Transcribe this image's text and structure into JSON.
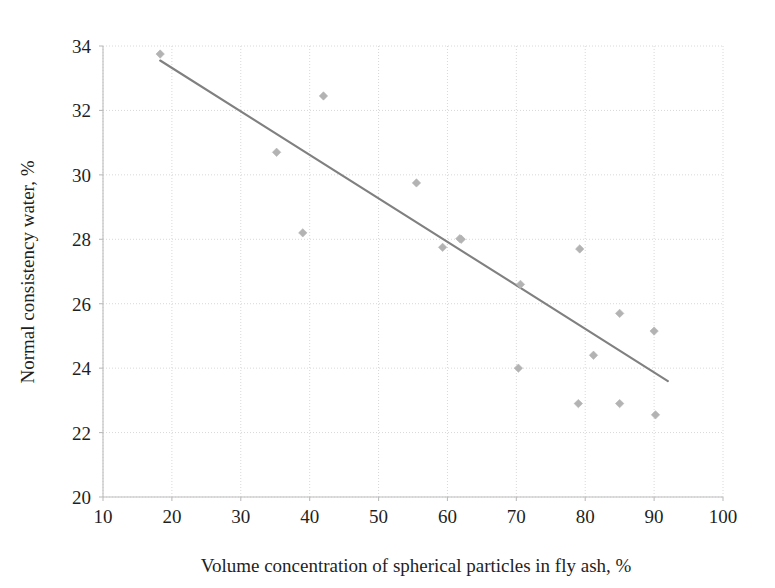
{
  "chart_data": {
    "type": "scatter",
    "title": "",
    "xlabel": "Volume concentration of spherical particles in fly ash, %",
    "ylabel": "Normal consistency water, %",
    "xlim": [
      10,
      100
    ],
    "ylim": [
      20,
      34
    ],
    "xticks": [
      10,
      20,
      30,
      40,
      50,
      60,
      70,
      80,
      90,
      100
    ],
    "yticks": [
      20,
      22,
      24,
      26,
      28,
      30,
      32,
      34
    ],
    "xtick_labels": [
      "10",
      "20",
      "30",
      "40",
      "50",
      "60",
      "70",
      "80",
      "90",
      "100"
    ],
    "ytick_labels": [
      "20",
      "22",
      "24",
      "26",
      "28",
      "30",
      "32",
      "34"
    ],
    "grid": true,
    "legend": "none",
    "marker": "diamond",
    "marker_color": "#b3b3b3",
    "trendline_color": "#808080",
    "grid_color": "#d8d8d8",
    "axis_color": "#bdbdbd",
    "points": [
      {
        "x": 18.3,
        "y": 33.75
      },
      {
        "x": 35.2,
        "y": 30.7
      },
      {
        "x": 39.0,
        "y": 28.2
      },
      {
        "x": 42.0,
        "y": 32.45
      },
      {
        "x": 55.5,
        "y": 29.75
      },
      {
        "x": 59.3,
        "y": 27.75
      },
      {
        "x": 62.0,
        "y": 28.0
      },
      {
        "x": 70.6,
        "y": 26.6
      },
      {
        "x": 70.3,
        "y": 24.0
      },
      {
        "x": 79.2,
        "y": 27.7
      },
      {
        "x": 79.0,
        "y": 22.9
      },
      {
        "x": 81.2,
        "y": 24.4
      },
      {
        "x": 85.0,
        "y": 25.7
      },
      {
        "x": 85.0,
        "y": 22.9
      },
      {
        "x": 90.0,
        "y": 25.15
      },
      {
        "x": 90.2,
        "y": 22.55
      },
      {
        "x": 61.8,
        "y": 28.02
      }
    ],
    "trendline": {
      "x0": 18.3,
      "y0": 33.55,
      "x1": 92.0,
      "y1": 23.6
    }
  }
}
